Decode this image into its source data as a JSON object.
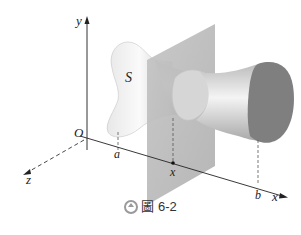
{
  "figure": {
    "labels": {
      "y_axis": "y",
      "x_axis": "x",
      "z_axis": "z",
      "origin": "O",
      "solid": "S",
      "a": "a",
      "b": "b",
      "x_point": "x"
    },
    "colors": {
      "plane": "#b8b8b8",
      "solid_light": "#f2f2f2",
      "solid_dark": "#8a8a8a",
      "end_face": "#7d7d7d",
      "axis": "#222222"
    }
  },
  "caption": {
    "icon": "circle-up-arrow-icon",
    "figure_char_icon": "figure-glyph-icon",
    "text": "圖 6-2",
    "number": "6-2"
  }
}
